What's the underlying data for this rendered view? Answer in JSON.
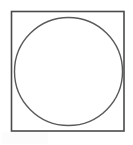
{
  "canvas": {
    "width": 133,
    "height": 145,
    "background_color": "#ffffff"
  },
  "figure": {
    "shapes": [
      {
        "name": "square",
        "kind": "rect",
        "x": 11.5,
        "y": 11.5,
        "width": 112.5,
        "height": 119.5,
        "stroke_color": "#4a4a4a",
        "stroke_width": 1.6,
        "fill": "none"
      },
      {
        "name": "circle",
        "kind": "circle",
        "cx": 68.5,
        "cy": 71.5,
        "r": 54.0,
        "stroke_color": "#5a5a5a",
        "stroke_width": 1.4,
        "fill": "none"
      }
    ],
    "artifacts": [
      {
        "name": "scan-smudge-bottom-left",
        "x": 2,
        "y": 132,
        "width": 46,
        "height": 12,
        "color": "#fcfcfc"
      }
    ]
  }
}
